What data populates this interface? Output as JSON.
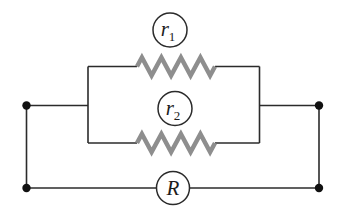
{
  "diagram": {
    "type": "circuit-schematic",
    "labels": {
      "r1_base": "r",
      "r1_sub": "1",
      "r2_base": "r",
      "r2_sub": "2",
      "equivalent": "R"
    },
    "colors": {
      "wire": "#2b2b2b",
      "resistor_zigzag": "#8e8e8e",
      "terminal_dot": "#111111",
      "label_text": "#1c1c1c",
      "background": "#ffffff"
    }
  }
}
